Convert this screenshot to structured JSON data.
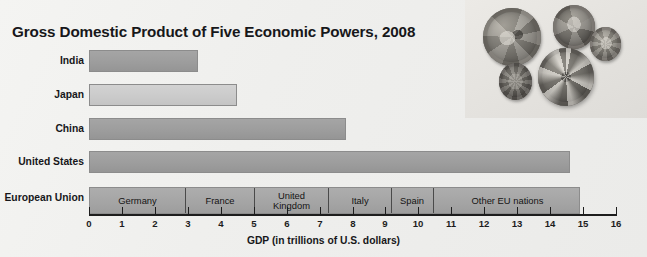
{
  "chart_data": {
    "type": "bar",
    "orientation": "horizontal",
    "title": "Gross Domestic Product of Five Economic Powers, 2008",
    "xlabel": "GDP (in trillions of U.S. dollars)",
    "ylabel": "",
    "xlim": [
      0,
      16
    ],
    "xticks": [
      "0",
      "1",
      "2",
      "3",
      "4",
      "5",
      "6",
      "7",
      "8",
      "9",
      "10",
      "11",
      "12",
      "13",
      "14",
      "15",
      "16"
    ],
    "grid": false,
    "legend": "none",
    "categories": [
      "India",
      "Japan",
      "China",
      "United States",
      "European Union"
    ],
    "values": [
      3.3,
      4.5,
      7.8,
      14.6,
      14.9
    ],
    "bars": [
      {
        "label": "India",
        "value": 3.3,
        "style": "solid"
      },
      {
        "label": "Japan",
        "value": 4.5,
        "style": "light"
      },
      {
        "label": "China",
        "value": 7.8,
        "style": "solid"
      },
      {
        "label": "United States",
        "value": 14.6,
        "style": "solid"
      },
      {
        "label": "European Union",
        "value": 14.9,
        "style": "stacked"
      }
    ],
    "stacked_detail": {
      "category": "European Union",
      "total": 14.9,
      "segments": [
        {
          "name": "Germany",
          "start": 0,
          "end": 2.9,
          "value": 2.9
        },
        {
          "name": "France",
          "start": 2.9,
          "end": 5.0,
          "value": 2.1
        },
        {
          "name": "United\nKingdom",
          "start": 5.0,
          "end": 7.25,
          "value": 2.25
        },
        {
          "name": "Italy",
          "start": 7.25,
          "end": 9.15,
          "value": 1.9
        },
        {
          "name": "Spain",
          "start": 9.15,
          "end": 10.45,
          "value": 1.3
        },
        {
          "name": "Other EU nations",
          "start": 10.45,
          "end": 14.9,
          "value": 4.45
        }
      ]
    },
    "colors": {
      "bar_solid": "#9d9d9d",
      "bar_light": "#cbcbcb",
      "bar_stacked": "#a5a5a5",
      "bar_border": "#8c8c8c",
      "segment_divider": "#4a4a4a",
      "axis": "#1d1d1d",
      "text": "#17171a",
      "background": "#efefed"
    }
  },
  "photo": {
    "name": "coins-photo",
    "caption": "",
    "coins": [
      {
        "name": "two-euro-coin",
        "tone": "#8e8b84"
      },
      {
        "name": "foreign-coin-top-right",
        "tone": "#7f7c76"
      },
      {
        "name": "small-coin-far-right",
        "tone": "#8a877f"
      },
      {
        "name": "small-coin-bottom-left",
        "tone": "#6f6c66"
      },
      {
        "name": "large-coin-bottom-center",
        "tone": "#8b888180"
      }
    ]
  }
}
